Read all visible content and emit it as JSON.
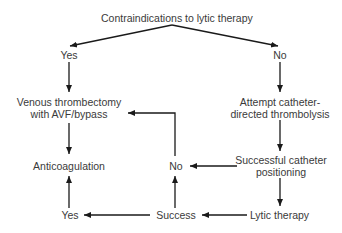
{
  "diagram": {
    "title": "Contraindications to lytic therapy",
    "nodes": {
      "yes_top": "Yes",
      "no_top": "No",
      "venous_line1": "Venous thrombectomy",
      "venous_line2": "with AVF/bypass",
      "attempt_line1": "Attempt catheter-",
      "attempt_line2": "directed thrombolysis",
      "anticoag": "Anticoagulation",
      "no_mid": "No",
      "positioning_line1": "Successful catheter",
      "positioning_line2": "positioning",
      "yes_bottom": "Yes",
      "success": "Success",
      "lytic": "Lytic therapy"
    },
    "colors": {
      "line": "#1a1a1a",
      "text": "#3a3a3a",
      "background": "#ffffff"
    }
  }
}
